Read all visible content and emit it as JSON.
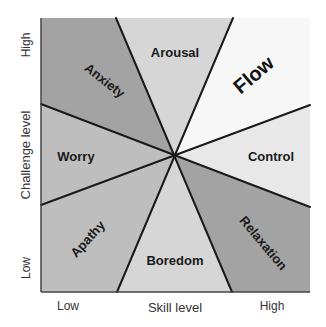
{
  "diagram": {
    "x_axis": {
      "label": "Skill level",
      "low": "Low",
      "high": "High"
    },
    "y_axis": {
      "label": "Challenge level",
      "low": "Low",
      "high": "High"
    },
    "regions": {
      "anxiety": {
        "label": "Anxiety",
        "color": "#a3a3a3"
      },
      "arousal": {
        "label": "Arousal",
        "color": "#d6d6d6"
      },
      "flow": {
        "label": "Flow",
        "color": "#f7f7f7"
      },
      "control": {
        "label": "Control",
        "color": "#e8e8e8"
      },
      "relaxation": {
        "label": "Relaxation",
        "color": "#a3a3a3"
      },
      "boredom": {
        "label": "Boredom",
        "color": "#d6d6d6"
      },
      "apathy": {
        "label": "Apathy",
        "color": "#bebebe"
      },
      "worry": {
        "label": "Worry",
        "color": "#bebebe"
      }
    },
    "line_color": "#1a1a1a",
    "frame_color": "#444444"
  }
}
